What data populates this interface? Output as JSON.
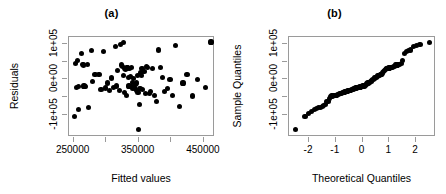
{
  "figure": {
    "kind": "r-regression-diagnostics",
    "panels": [
      "a",
      "b"
    ]
  },
  "chart_data": [
    {
      "type": "scatter",
      "panel_label": "(a)",
      "title": "(a)",
      "xlabel": "Fitted values",
      "ylabel": "Residuals",
      "xlim": [
        243000,
        467000
      ],
      "ylim": [
        -160000,
        118000
      ],
      "grid": false,
      "legend": null,
      "xticks": [
        250000,
        300000,
        350000,
        400000,
        450000
      ],
      "xticklabels": [
        "250000",
        "",
        "350000",
        "",
        "450000"
      ],
      "yticks": [
        -100000,
        -50000,
        0,
        50000,
        100000
      ],
      "yticklabels": [
        "-1e+05",
        "",
        "0e+00",
        "",
        "1e+05"
      ],
      "x": [
        252000,
        253000,
        254000,
        256000,
        257000,
        258000,
        262000,
        264000,
        265000,
        266000,
        268000,
        271000,
        273000,
        277000,
        279000,
        283000,
        289000,
        292000,
        296000,
        299000,
        302000,
        305000,
        308000,
        311000,
        314000,
        316000,
        318000,
        320000,
        322000,
        324000,
        325000,
        326000,
        327000,
        328000,
        329000,
        330000,
        331000,
        332000,
        333000,
        334000,
        335000,
        336000,
        337000,
        338000,
        339000,
        340000,
        341000,
        342000,
        343000,
        344000,
        345000,
        346000,
        347000,
        348000,
        349000,
        350000,
        351000,
        352000,
        353000,
        354000,
        355000,
        356000,
        358000,
        360000,
        362000,
        364000,
        366000,
        368000,
        371000,
        374000,
        377000,
        380000,
        383000,
        386000,
        390000,
        394000,
        398000,
        402000,
        406000,
        412000,
        418000,
        424000,
        432000,
        440000,
        452000,
        461000
      ],
      "y": [
        -104000,
        44000,
        -22000,
        52000,
        -20000,
        -84000,
        71000,
        41000,
        40000,
        -18000,
        -19000,
        42000,
        -77000,
        80000,
        -6000,
        14000,
        13000,
        -29000,
        78000,
        -24000,
        -10000,
        -30000,
        4000,
        -22000,
        92000,
        -18000,
        24000,
        -30000,
        96000,
        40000,
        36000,
        11000,
        102000,
        -36000,
        30000,
        28000,
        -44000,
        34000,
        32000,
        6000,
        -18000,
        30000,
        8000,
        -20000,
        34000,
        -24000,
        -8000,
        2000,
        -26000,
        -22000,
        -14000,
        -30000,
        -10000,
        10000,
        -36000,
        -140000,
        -70000,
        -26000,
        18000,
        12000,
        30000,
        -28000,
        22000,
        -38000,
        36000,
        34000,
        -40000,
        -34000,
        30000,
        -44000,
        -62000,
        82000,
        34000,
        6000,
        -34000,
        -26000,
        0,
        -44000,
        94000,
        -76000,
        -10000,
        14000,
        -46000,
        -1000,
        -22000,
        104000
      ]
    },
    {
      "type": "scatter",
      "panel_label": "(b)",
      "title": "(b)",
      "xlabel": "Theoretical Quantiles",
      "ylabel": "Sample Quantiles",
      "xlim": [
        -2.75,
        2.75
      ],
      "ylim": [
        -160000,
        118000
      ],
      "grid": false,
      "legend": null,
      "xticks": [
        -2,
        -1,
        0,
        1,
        2
      ],
      "xticklabels": [
        "-2",
        "-1",
        "0",
        "1",
        "2"
      ],
      "yticks": [
        -100000,
        -50000,
        0,
        50000,
        100000
      ],
      "yticklabels": [
        "-1e+05",
        "",
        "0e+00",
        "",
        "1e+05"
      ],
      "x": [
        -2.52,
        -2.15,
        -2.02,
        -1.9,
        -1.8,
        -1.72,
        -1.64,
        -1.57,
        -1.51,
        -1.45,
        -1.39,
        -1.34,
        -1.29,
        -1.24,
        -1.2,
        -1.15,
        -1.11,
        -1.07,
        -1.03,
        -0.99,
        -0.96,
        -0.92,
        -0.89,
        -0.85,
        -0.82,
        -0.79,
        -0.76,
        -0.72,
        -0.69,
        -0.66,
        -0.63,
        -0.6,
        -0.58,
        -0.55,
        -0.52,
        -0.49,
        -0.46,
        -0.44,
        -0.41,
        -0.38,
        -0.35,
        -0.33,
        -0.3,
        -0.27,
        -0.25,
        -0.22,
        -0.2,
        -0.17,
        -0.14,
        -0.12,
        -0.09,
        -0.07,
        -0.04,
        -0.01,
        0.01,
        0.04,
        0.07,
        0.09,
        0.12,
        0.14,
        0.17,
        0.2,
        0.22,
        0.25,
        0.27,
        0.3,
        0.33,
        0.35,
        0.38,
        0.41,
        0.44,
        0.46,
        0.49,
        0.52,
        0.55,
        0.58,
        0.6,
        0.63,
        0.66,
        0.69,
        0.72,
        0.76,
        0.79,
        0.82,
        0.85,
        0.89,
        0.92,
        0.96,
        0.99,
        1.03,
        1.07,
        1.11,
        1.15,
        1.2,
        1.24,
        1.29,
        1.34,
        1.39,
        1.45,
        1.51,
        1.57,
        1.64,
        1.72,
        1.8,
        1.9,
        2.02,
        2.15,
        2.52
      ],
      "y": [
        -140000,
        -104000,
        -95000,
        -88000,
        -84000,
        -80000,
        -78000,
        -77000,
        -76000,
        -72000,
        -70000,
        -62000,
        -62000,
        -52000,
        -48000,
        -46000,
        -46000,
        -45000,
        -44000,
        -44000,
        -44000,
        -42000,
        -41000,
        -40000,
        -39000,
        -38000,
        -37000,
        -36000,
        -36000,
        -35000,
        -34000,
        -34000,
        -33000,
        -32000,
        -31000,
        -30000,
        -30000,
        -30000,
        -29000,
        -28000,
        -27000,
        -26000,
        -26000,
        -25000,
        -24000,
        -24000,
        -23000,
        -22000,
        -22000,
        -22000,
        -21000,
        -20000,
        -20000,
        -19000,
        -18000,
        -18000,
        -18000,
        -17000,
        -16000,
        -14000,
        -12000,
        -10000,
        -10000,
        -9000,
        -8000,
        -6000,
        -5000,
        -3000,
        -1000,
        0,
        2000,
        4000,
        6000,
        6000,
        8000,
        10000,
        11000,
        12000,
        13000,
        14000,
        14000,
        18000,
        22000,
        24000,
        28000,
        30000,
        30000,
        30000,
        32000,
        34000,
        34000,
        34000,
        36000,
        36000,
        40000,
        40000,
        41000,
        42000,
        44000,
        52000,
        71000,
        78000,
        80000,
        82000,
        92000,
        94000,
        96000,
        102000,
        104000,
        104000,
        112000
      ]
    }
  ]
}
